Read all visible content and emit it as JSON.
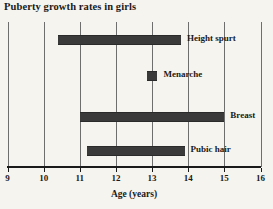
{
  "chart_data": {
    "type": "bar",
    "orientation": "horizontal-range",
    "title": "Puberty growth rates in girls",
    "xlabel": "Age (years)",
    "ylabel": "",
    "xlim": [
      9,
      16
    ],
    "xticks": [
      9,
      10,
      11,
      12,
      13,
      14,
      15,
      16
    ],
    "xtick_labels": [
      "9",
      "10",
      "11",
      "12",
      "13",
      "14",
      "15",
      "16"
    ],
    "grid": "vertical",
    "legend": "none",
    "bar_color": "#3a3a3a",
    "background_color": "#f6f4ef",
    "axis_color": "#1a1a1a",
    "gridline_color": "#6e6e6e",
    "series": [
      {
        "name": "Height spurt",
        "label": "Height spurt",
        "start": 10.4,
        "end": 13.8,
        "row": 0
      },
      {
        "name": "Menarche",
        "label": "Menarche",
        "start": 12.85,
        "end": 13.15,
        "row": 1
      },
      {
        "name": "Breast",
        "label": "Breast",
        "start": 11.0,
        "end": 15.0,
        "row": 2
      },
      {
        "name": "Pubic hair",
        "label": "Pubic hair",
        "start": 11.2,
        "end": 13.9,
        "row": 3
      }
    ]
  },
  "figure": {
    "title": "Puberty growth rates in girls",
    "axis": {
      "x_title": "Age (years)",
      "ticks": [
        "9",
        "10",
        "11",
        "12",
        "13",
        "14",
        "15",
        "16"
      ]
    },
    "bars": [
      {
        "label": "Height spurt"
      },
      {
        "label": "Menarche"
      },
      {
        "label": "Breast"
      },
      {
        "label": "Pubic hair"
      }
    ]
  }
}
